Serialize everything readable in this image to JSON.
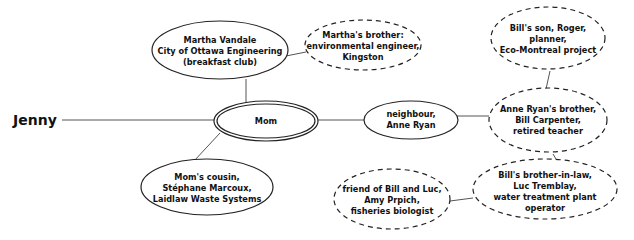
{
  "diagram": {
    "root": {
      "label": "Jenny"
    },
    "nodes": [
      {
        "id": "mom",
        "lines": [
          "Mom"
        ],
        "style": "double"
      },
      {
        "id": "martha",
        "lines": [
          "Martha Vandale",
          "City of Ottawa Engineering",
          "(breakfast club)"
        ],
        "style": "solid"
      },
      {
        "id": "marthas-brother",
        "lines": [
          "Martha's brother:",
          "environmental engineer,",
          "Kingston"
        ],
        "style": "dashed"
      },
      {
        "id": "moms-cousin",
        "lines": [
          "Mom's cousin,",
          "Stéphane Marcoux,",
          "Laidlaw Waste Systems"
        ],
        "style": "solid"
      },
      {
        "id": "neighbour",
        "lines": [
          "neighbour,",
          "Anne Ryan"
        ],
        "style": "solid"
      },
      {
        "id": "bills-son",
        "lines": [
          "Bill's son, Roger,",
          "planner,",
          "Eco-Montreal project"
        ],
        "style": "dashed"
      },
      {
        "id": "annes-brother",
        "lines": [
          "Anne Ryan's brother,",
          "Bill Carpenter,",
          "retired teacher"
        ],
        "style": "dashed"
      },
      {
        "id": "bills-brother-in-law",
        "lines": [
          "Bill's brother-in-law,",
          "Luc Tremblay,",
          "water treatment plant",
          "operator"
        ],
        "style": "dashed"
      },
      {
        "id": "friend",
        "lines": [
          "friend of Bill and Luc,",
          "Amy Prpich,",
          "fisheries biologist"
        ],
        "style": "dashed"
      }
    ],
    "edges": [
      [
        "jenny",
        "mom"
      ],
      [
        "mom",
        "martha"
      ],
      [
        "martha",
        "marthas-brother"
      ],
      [
        "mom",
        "moms-cousin"
      ],
      [
        "mom",
        "neighbour"
      ],
      [
        "neighbour",
        "annes-brother"
      ],
      [
        "annes-brother",
        "bills-son"
      ],
      [
        "annes-brother",
        "bills-brother-in-law"
      ],
      [
        "bills-brother-in-law",
        "friend"
      ]
    ],
    "colors": {
      "stroke": "#222222",
      "line": "#555555",
      "fill": "#ffffff",
      "text": "#111111"
    }
  }
}
